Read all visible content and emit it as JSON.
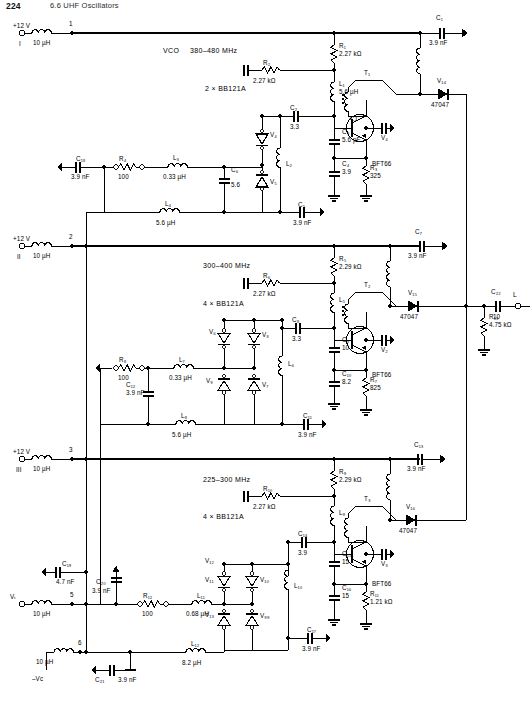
{
  "page": {
    "header_number": "224",
    "header_title": "6.6  UHF Oscillators",
    "width": 530,
    "height": 703,
    "line_color": "#000000"
  },
  "supplies": [
    {
      "id": "sup1",
      "label": "+12 V",
      "terminal": "I",
      "node": "1",
      "choke": "10 µH"
    },
    {
      "id": "sup2",
      "label": "+12 V",
      "terminal": "II",
      "node": "2",
      "choke": "10 µH"
    },
    {
      "id": "sup3",
      "label": "+12 V",
      "terminal": "III",
      "node": "3",
      "choke": "10 µH"
    },
    {
      "id": "sup4",
      "label": "Vₜ",
      "terminal": "",
      "node": "5",
      "choke": "10 µH"
    },
    {
      "id": "sup5",
      "label": "–Vᴄ",
      "terminal": "",
      "node": "6",
      "choke": "10 µH"
    }
  ],
  "stages": [
    {
      "id": "stage1",
      "name": "VCO",
      "band": "380–480 MHz",
      "varactor_note": "2 × BB121A",
      "transistor": {
        "ref": "V₄",
        "type": "BFT66"
      },
      "transformer": {
        "ref": "T₁",
        "ratio": "4:1"
      },
      "output_diode": {
        "ref": "V₁₄",
        "type": "47047"
      }
    },
    {
      "id": "stage2",
      "name": "",
      "band": "300–400 MHz",
      "varactor_note": "4 × BB121A",
      "transistor": {
        "ref": "V₂",
        "type": "BFT66"
      },
      "transformer": {
        "ref": "T₂",
        "ratio": ""
      },
      "output_diode": {
        "ref": "V₁₅",
        "type": "47047"
      }
    },
    {
      "id": "stage3",
      "name": "",
      "band": "225–300 MHz",
      "varactor_note": "4 × BB121A",
      "transistor": {
        "ref": "V₃",
        "type": "BFT66"
      },
      "transformer": {
        "ref": "T₃",
        "ratio": ""
      },
      "output_diode": {
        "ref": "V₁₆",
        "type": "47047"
      }
    }
  ],
  "resistors": [
    {
      "ref": "R₁",
      "value": "2.27 kΩ"
    },
    {
      "ref": "R₂",
      "value": "2.27 kΩ"
    },
    {
      "ref": "R₃",
      "value": "325"
    },
    {
      "ref": "R₄",
      "value": "100"
    },
    {
      "ref": "R₅",
      "value": "2.29 kΩ"
    },
    {
      "ref": "R₆",
      "value": "2.27 kΩ"
    },
    {
      "ref": "R₇",
      "value": "825"
    },
    {
      "ref": "R₈",
      "value": "100"
    },
    {
      "ref": "R₉",
      "value": "2.29 kΩ"
    },
    {
      "ref": "R₁₀",
      "value": "2.27 kΩ"
    },
    {
      "ref": "R₁₁",
      "value": "1.21 kΩ"
    },
    {
      "ref": "R₁₂",
      "value": "100"
    },
    {
      "ref": "R₁₃",
      "value": "4.75 kΩ"
    }
  ],
  "capacitors": [
    {
      "ref": "C₁",
      "value": "3.9 nF"
    },
    {
      "ref": "C₂",
      "value": "3.3"
    },
    {
      "ref": "C₃",
      "value": "5.6 pF"
    },
    {
      "ref": "C₄",
      "value": "3.9"
    },
    {
      "ref": "C₅",
      "value": "3.9 nF"
    },
    {
      "ref": "C₆",
      "value": "5.6"
    },
    {
      "ref": "C₇",
      "value": "3.9 nF"
    },
    {
      "ref": "C₈",
      "value": "3.3"
    },
    {
      "ref": "C₉",
      "value": "10"
    },
    {
      "ref": "C₁₀",
      "value": "8.2"
    },
    {
      "ref": "C₁₁",
      "value": "3.9 nF"
    },
    {
      "ref": "C₁₂",
      "value": "3.9 nF"
    },
    {
      "ref": "C₁₃",
      "value": "3.9 nF"
    },
    {
      "ref": "C₁₄",
      "value": "3.9"
    },
    {
      "ref": "C₁₅",
      "value": "15"
    },
    {
      "ref": "C₁₆",
      "value": "15"
    },
    {
      "ref": "C₁₇",
      "value": "3.9 nF"
    },
    {
      "ref": "C₁₈",
      "value": "3.9 nF"
    },
    {
      "ref": "C₁₉",
      "value": "4.7 nF"
    },
    {
      "ref": "C₂₀",
      "value": "3.9 nF"
    },
    {
      "ref": "C₂₁",
      "value": "3.9 nF"
    },
    {
      "ref": "C₂₂",
      "value": "10"
    }
  ],
  "inductors": [
    {
      "ref": "L₁",
      "value": "5.6 µH"
    },
    {
      "ref": "L₂",
      "value": ""
    },
    {
      "ref": "L₃",
      "value": "0.33 µH"
    },
    {
      "ref": "L₄",
      "value": "5.6 µH"
    },
    {
      "ref": "L₅",
      "value": ""
    },
    {
      "ref": "L₆",
      "value": ""
    },
    {
      "ref": "L₇",
      "value": "0.33 µH"
    },
    {
      "ref": "L₈",
      "value": "5.6 µH"
    },
    {
      "ref": "L₉",
      "value": ""
    },
    {
      "ref": "L₁₀",
      "value": ""
    },
    {
      "ref": "L₁₁",
      "value": "0.68 µH"
    },
    {
      "ref": "L₁₂",
      "value": "8.2 µH"
    }
  ],
  "diodes": [
    {
      "ref": "V₄"
    },
    {
      "ref": "V₅"
    },
    {
      "ref": "V₆"
    },
    {
      "ref": "V₇"
    },
    {
      "ref": "V₈"
    },
    {
      "ref": "V₉"
    },
    {
      "ref": "V₉₉"
    },
    {
      "ref": "V₁₀"
    },
    {
      "ref": "V₁₁"
    },
    {
      "ref": "V₁₂"
    },
    {
      "ref": "V₁₃"
    }
  ],
  "output": {
    "label": "L"
  },
  "nodes": {
    "n1": "1",
    "n2": "2",
    "n3": "3",
    "n5": "5",
    "n6": "6"
  }
}
